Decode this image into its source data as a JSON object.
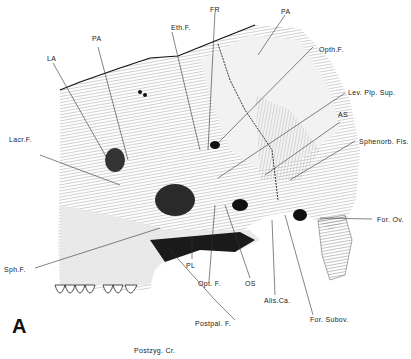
{
  "figure": {
    "panel_label": "A",
    "caption_below": "Postzyg. Cr.",
    "labels": {
      "FR": "FR",
      "PA_top": "PA",
      "EthF": "Eth.F.",
      "PA_left": "PA",
      "LA": "LA",
      "OpthF": "Opth.F.",
      "LevPlpSup": "Lev. Plp. Sup.",
      "AS": "AS",
      "LacrF": "Lacr.F.",
      "SphenorbFis": "Sphenorb. Fis.",
      "ForOv": "For. Ov.",
      "SphF": "Sph.F.",
      "PL": "PL",
      "OptF": "Opt. F.",
      "OS": "OS",
      "AlisCa": "Alis.Ca.",
      "ForSubov": "For. Subov.",
      "PostpalF": "Postpal. F."
    }
  }
}
